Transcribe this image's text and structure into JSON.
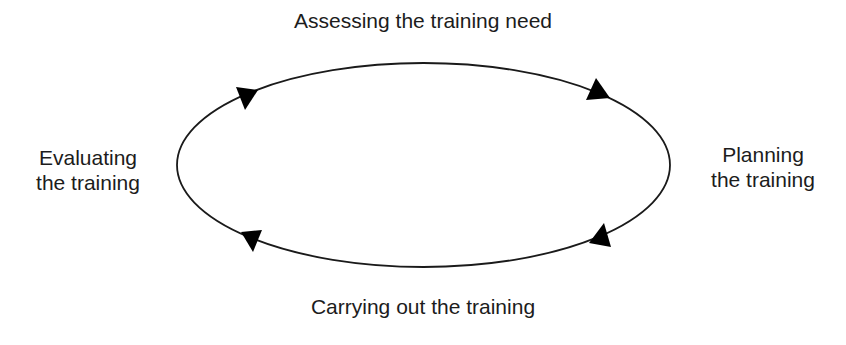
{
  "diagram": {
    "type": "cycle",
    "direction": "clockwise",
    "stages": [
      {
        "position": "top",
        "lines": [
          "Assessing the training need"
        ]
      },
      {
        "position": "right",
        "lines": [
          "Planning",
          "the training"
        ]
      },
      {
        "position": "bottom",
        "lines": [
          "Carrying out the training"
        ]
      },
      {
        "position": "left",
        "lines": [
          "Evaluating",
          "the training"
        ]
      }
    ],
    "colors": {
      "line": "#1a1a1a",
      "arrow": "#000000",
      "text": "#1c1c1c",
      "background": "#ffffff"
    }
  }
}
